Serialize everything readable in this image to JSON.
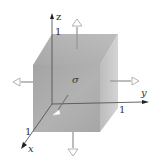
{
  "diagram": {
    "stress_symbol": "σ",
    "axes": {
      "x": "x",
      "y": "y",
      "z": "z"
    },
    "edge_lengths": {
      "z_edge": "1",
      "y_edge": "1",
      "x_edge": "1"
    },
    "colors": {
      "top_face": "#b4b4b4",
      "front_face": "#a9a9a9",
      "right_face": "#c6c6c6",
      "axis": "#444444",
      "arrow_fill": "#ffffff",
      "arrow_stroke": "#aaaaaa",
      "arrow_shaft": "#999999"
    },
    "arrows": [
      {
        "face": "top",
        "direction": "up"
      },
      {
        "face": "bottom",
        "direction": "down"
      },
      {
        "face": "left",
        "direction": "left"
      },
      {
        "face": "right",
        "direction": "right"
      },
      {
        "face": "front",
        "direction": "toward-viewer"
      }
    ]
  }
}
